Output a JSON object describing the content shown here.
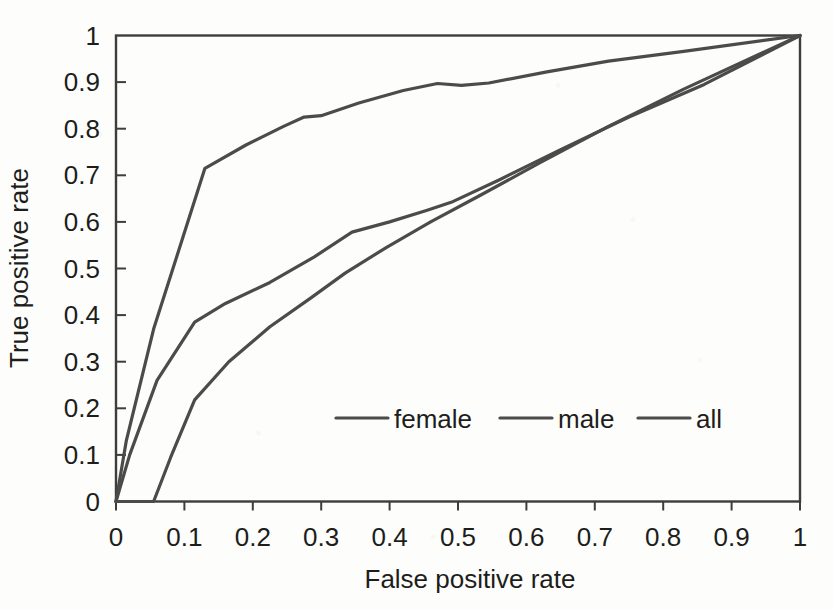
{
  "chart_data": {
    "type": "line",
    "title": "",
    "xlabel": "False positive rate",
    "ylabel": "True positive rate",
    "xlim": [
      0,
      1
    ],
    "ylim": [
      0,
      1
    ],
    "grid": false,
    "legend_position": "inside-center-lower",
    "line_color": "#4b4b4b",
    "axis_color": "#3d3d3d",
    "x_ticks": [
      "0",
      "0.1",
      "0.2",
      "0.3",
      "0.4",
      "0.5",
      "0.6",
      "0.7",
      "0.8",
      "0.9",
      "1"
    ],
    "y_ticks": [
      "0",
      "0.1",
      "0.2",
      "0.3",
      "0.4",
      "0.5",
      "0.6",
      "0.7",
      "0.8",
      "0.9",
      "1"
    ],
    "x_tick_values": [
      0,
      0.1,
      0.2,
      0.3,
      0.4,
      0.5,
      0.6,
      0.7,
      0.8,
      0.9,
      1
    ],
    "y_tick_values": [
      0,
      0.1,
      0.2,
      0.3,
      0.4,
      0.5,
      0.6,
      0.7,
      0.8,
      0.9,
      1
    ],
    "series": [
      {
        "name": "female",
        "x": [
          0,
          0.015,
          0.055,
          0.13,
          0.19,
          0.245,
          0.275,
          0.3,
          0.355,
          0.42,
          0.47,
          0.505,
          0.545,
          0.63,
          0.72,
          0.83,
          1
        ],
        "y": [
          0,
          0.13,
          0.37,
          0.715,
          0.765,
          0.805,
          0.825,
          0.828,
          0.855,
          0.882,
          0.897,
          0.893,
          0.898,
          0.922,
          0.945,
          0.966,
          1
        ]
      },
      {
        "name": "male",
        "x": [
          0,
          0.02,
          0.06,
          0.115,
          0.16,
          0.225,
          0.29,
          0.345,
          0.4,
          0.455,
          0.49,
          0.56,
          0.65,
          0.75,
          0.86,
          1
        ],
        "y": [
          0,
          0.1,
          0.26,
          0.385,
          0.425,
          0.47,
          0.525,
          0.578,
          0.6,
          0.625,
          0.642,
          0.69,
          0.755,
          0.825,
          0.895,
          1
        ]
      },
      {
        "name": "all",
        "x": [
          0,
          0.055,
          0.08,
          0.115,
          0.165,
          0.225,
          0.285,
          0.335,
          0.395,
          0.46,
          0.53,
          0.62,
          0.72,
          0.83,
          1
        ],
        "y": [
          0,
          0,
          0.095,
          0.218,
          0.3,
          0.375,
          0.437,
          0.49,
          0.545,
          0.6,
          0.655,
          0.727,
          0.805,
          0.885,
          1
        ]
      }
    ]
  },
  "legend": {
    "items": [
      {
        "label": "female"
      },
      {
        "label": "male"
      },
      {
        "label": "all"
      }
    ]
  },
  "axes": {
    "x_title": "False positive rate",
    "y_title": "True positive rate"
  }
}
